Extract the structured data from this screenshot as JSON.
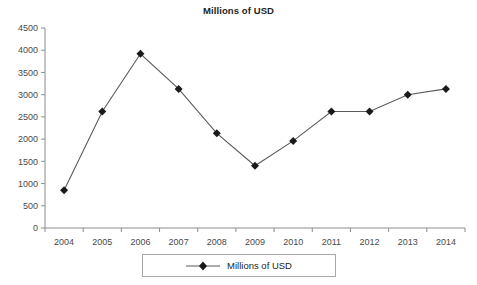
{
  "chart_data": {
    "type": "line",
    "title": "Millions of USD",
    "xlabel": "",
    "ylabel": "",
    "categories": [
      "2004",
      "2005",
      "2006",
      "2007",
      "2008",
      "2009",
      "2010",
      "2011",
      "2012",
      "2013",
      "2014"
    ],
    "values": [
      850,
      2620,
      3920,
      3130,
      2130,
      1400,
      1960,
      2620,
      2620,
      3000,
      3130
    ],
    "series": [
      {
        "name": "Millions of USD",
        "values": [
          850,
          2620,
          3920,
          3130,
          2130,
          1400,
          1960,
          2620,
          2620,
          3000,
          3130
        ]
      }
    ],
    "ylim": [
      0,
      4500
    ],
    "ytick_values": [
      0,
      500,
      1000,
      1500,
      2000,
      2500,
      3000,
      3500,
      4000,
      4500
    ],
    "ytick_labels": [
      "0",
      "500",
      "1000",
      "1500",
      "2000",
      "2500",
      "3000",
      "3500",
      "4000",
      "4500"
    ],
    "grid": false,
    "legend_position": "bottom",
    "marker": "diamond",
    "line_color": "#5a5a5a",
    "marker_color": "#1a1a1a",
    "axis_color": "#8c8c8c"
  },
  "legend": {
    "entries": [
      {
        "label": "Millions of USD",
        "marker": "diamond-marker-icon"
      }
    ]
  }
}
